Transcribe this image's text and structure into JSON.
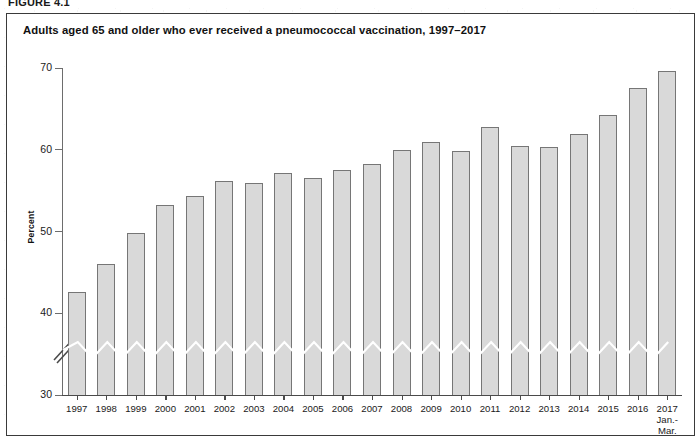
{
  "figure": {
    "number_label": "FIGURE 4.1",
    "title": "Adults aged 65 and older who ever received a pneumococcal vaccination, 1997–2017"
  },
  "axes": {
    "y_title": "Percent",
    "y_ticks": [
      "30",
      "40",
      "50",
      "60",
      "70"
    ],
    "y_min": 30,
    "y_max": 70,
    "has_axis_break": true,
    "axis_break_note": "white zigzag break across bars near 36 percent"
  },
  "chart_data": {
    "type": "bar",
    "title": "Adults aged 65 and older who ever received a pneumococcal vaccination, 1997–2017",
    "xlabel": "",
    "ylabel": "Percent",
    "ylim": [
      30,
      70
    ],
    "grid": false,
    "legend": "none",
    "categories": [
      "1997",
      "1998",
      "1999",
      "2000",
      "2001",
      "2002",
      "2003",
      "2004",
      "2005",
      "2006",
      "2007",
      "2008",
      "2009",
      "2010",
      "2011",
      "2012",
      "2013",
      "2014",
      "2015",
      "2016",
      "2017"
    ],
    "category_sublabels": [
      "",
      "",
      "",
      "",
      "",
      "",
      "",
      "",
      "",
      "",
      "",
      "",
      "",
      "",
      "",
      "",
      "",
      "",
      "",
      "",
      "Jan.–\nMar."
    ],
    "values": [
      42.6,
      46.0,
      49.8,
      53.3,
      54.3,
      56.2,
      55.9,
      57.1,
      56.6,
      57.5,
      58.2,
      60.0,
      61.0,
      59.9,
      62.8,
      60.5,
      60.3,
      61.9,
      64.2,
      67.5,
      69.6
    ],
    "bar_fill_color": "#d9d9d9",
    "bar_border_color": "#767676"
  },
  "last_category": {
    "year": "2017",
    "line2": "Jan.-",
    "line3": "Mar."
  }
}
